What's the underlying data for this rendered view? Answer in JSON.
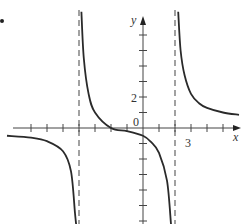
{
  "chart_data": {
    "type": "line",
    "title": "",
    "xlabel": "x",
    "ylabel": "y",
    "origin_label": "0",
    "labeled_ticks": {
      "x": [
        {
          "value": 3,
          "label": "3"
        }
      ],
      "y": [
        {
          "value": 2,
          "label": "2"
        }
      ]
    },
    "xlim": [
      -8.5,
      6.2
    ],
    "ylim": [
      -6.2,
      7.5
    ],
    "x_ticks": [
      -7,
      -6,
      -5,
      -4,
      -3,
      -2,
      -1,
      1,
      2,
      3,
      4,
      5
    ],
    "y_ticks": [
      -6,
      -5,
      -4,
      -3,
      -2,
      -1,
      1,
      2,
      3,
      4,
      5,
      6
    ],
    "asymptotes": {
      "vertical": [
        -4,
        2
      ],
      "style": "dashed"
    },
    "series": [
      {
        "name": "left branch (x < -4)",
        "points": [
          [
            -8.5,
            -0.5
          ],
          [
            -7,
            -0.62
          ],
          [
            -6,
            -0.85
          ],
          [
            -5,
            -1.5
          ],
          [
            -4.5,
            -2.8
          ],
          [
            -4.25,
            -5.5
          ],
          [
            -4.18,
            -6.2
          ]
        ]
      },
      {
        "name": "middle branch (-4 < x < 2)",
        "points": [
          [
            -3.85,
            7.5
          ],
          [
            -3.7,
            4.5
          ],
          [
            -3.4,
            2.2
          ],
          [
            -3,
            1.0
          ],
          [
            -2,
            0.0
          ],
          [
            -1,
            -0.2
          ],
          [
            0,
            -0.5
          ],
          [
            0.5,
            -0.9
          ],
          [
            1,
            -1.6
          ],
          [
            1.5,
            -3.4
          ],
          [
            1.75,
            -6.2
          ]
        ]
      },
      {
        "name": "right branch (x > 2)",
        "points": [
          [
            2.2,
            7.5
          ],
          [
            2.35,
            5.0
          ],
          [
            2.6,
            3.4
          ],
          [
            3,
            2.2
          ],
          [
            3.5,
            1.6
          ],
          [
            4,
            1.3
          ],
          [
            5,
            1.0
          ],
          [
            6,
            0.85
          ]
        ]
      }
    ]
  },
  "labels": {
    "y_axis": "y",
    "x_axis": "x",
    "origin": "0",
    "tick_2": "2",
    "tick_3": "3"
  }
}
